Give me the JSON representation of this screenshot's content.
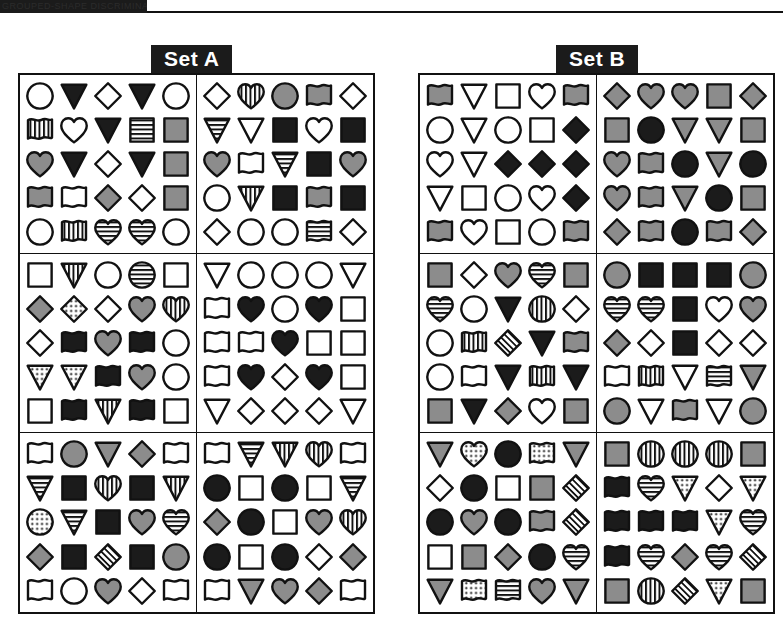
{
  "topbar": {
    "text": "GROUPED-SHAPE DISCRIMINATION"
  },
  "sets": [
    {
      "name": "Set A",
      "label_name": "set-a-label",
      "blocks": [
        {
          "name": "set-a-block-1",
          "rows": [
            [
              "circle|white",
              "triangle-down|black",
              "diamond|white",
              "triangle-down|black",
              "circle|white"
            ],
            [
              "flag|vstripe",
              "heart|white",
              "triangle-down|black",
              "square|hstripe",
              "square|gray"
            ],
            [
              "heart|gray",
              "triangle-down|black",
              "diamond|white",
              "triangle-down|black",
              "square|gray"
            ],
            [
              "flag|gray",
              "flag|white",
              "diamond|gray",
              "diamond|white",
              "square|gray"
            ],
            [
              "circle|white",
              "flag|vstripe",
              "heart|hstripe",
              "heart|hstripe",
              "circle|white"
            ]
          ]
        },
        {
          "name": "set-a-block-2",
          "rows": [
            [
              "diamond|white",
              "heart|vstripe",
              "circle|gray",
              "flag|gray",
              "diamond|white"
            ],
            [
              "triangle-down|hstripe",
              "triangle-down|white",
              "square|black",
              "heart|white",
              "square|black"
            ],
            [
              "heart|gray",
              "flag|white",
              "triangle-down|hstripe",
              "square|black",
              "heart|gray"
            ],
            [
              "circle|white",
              "triangle-down|vstripe",
              "square|black",
              "flag|gray",
              "square|black"
            ],
            [
              "diamond|white",
              "circle|white",
              "circle|white",
              "flag|hstripe",
              "diamond|white"
            ]
          ]
        },
        {
          "name": "set-a-block-3",
          "rows": [
            [
              "square|white",
              "triangle-down|vstripe",
              "circle|white",
              "circle|hstripe",
              "square|white"
            ],
            [
              "diamond|gray",
              "diamond|dots",
              "diamond|white",
              "heart|gray",
              "heart|vstripe"
            ],
            [
              "diamond|white",
              "flag|black",
              "heart|gray",
              "flag|black",
              "circle|white"
            ],
            [
              "triangle-down|dots",
              "triangle-down|dots",
              "flag|black",
              "heart|gray",
              "circle|white"
            ],
            [
              "square|white",
              "flag|black",
              "triangle-down|vstripe",
              "flag|black",
              "square|white"
            ]
          ]
        },
        {
          "name": "set-a-block-4",
          "rows": [
            [
              "triangle-down|white",
              "circle|white",
              "circle|white",
              "circle|white",
              "triangle-down|white"
            ],
            [
              "flag|white",
              "heart|black",
              "circle|white",
              "heart|black",
              "square|white"
            ],
            [
              "flag|white",
              "flag|white",
              "heart|black",
              "square|white",
              "square|white"
            ],
            [
              "flag|white",
              "heart|black",
              "diamond|white",
              "heart|black",
              "square|white"
            ],
            [
              "triangle-down|white",
              "diamond|white",
              "diamond|white",
              "diamond|white",
              "triangle-down|white"
            ]
          ]
        },
        {
          "name": "set-a-block-5",
          "rows": [
            [
              "flag|white",
              "circle|gray",
              "triangle-down|gray",
              "diamond|gray",
              "flag|white"
            ],
            [
              "triangle-down|hstripe",
              "square|black",
              "heart|vstripe",
              "square|black",
              "triangle-down|vstripe"
            ],
            [
              "circle|dots",
              "triangle-down|hstripe",
              "square|black",
              "heart|gray",
              "heart|hstripe"
            ],
            [
              "diamond|gray",
              "square|black",
              "diamond|hatch",
              "square|black",
              "circle|gray"
            ],
            [
              "flag|white",
              "circle|white",
              "heart|gray",
              "diamond|white",
              "flag|white"
            ]
          ]
        },
        {
          "name": "set-a-block-6",
          "rows": [
            [
              "flag|white",
              "triangle-down|hstripe",
              "triangle-down|vstripe",
              "heart|vstripe",
              "flag|white"
            ],
            [
              "circle|black",
              "square|white",
              "circle|black",
              "square|white",
              "triangle-down|hstripe"
            ],
            [
              "diamond|gray",
              "circle|black",
              "square|white",
              "heart|gray",
              "heart|vstripe"
            ],
            [
              "circle|black",
              "square|white",
              "circle|black",
              "diamond|white",
              "diamond|gray"
            ],
            [
              "flag|white",
              "triangle-down|gray",
              "heart|gray",
              "diamond|gray",
              "flag|white"
            ]
          ]
        }
      ]
    },
    {
      "name": "Set B",
      "label_name": "set-b-label",
      "blocks": [
        {
          "name": "set-b-block-1",
          "rows": [
            [
              "flag|gray",
              "triangle-down|white",
              "square|white",
              "heart|white",
              "flag|gray"
            ],
            [
              "circle|white",
              "triangle-down|white",
              "circle|white",
              "square|white",
              "diamond|black"
            ],
            [
              "heart|white",
              "triangle-down|white",
              "diamond|black",
              "diamond|black",
              "diamond|black"
            ],
            [
              "triangle-down|white",
              "square|white",
              "circle|white",
              "heart|white",
              "diamond|black"
            ],
            [
              "flag|gray",
              "heart|white",
              "square|white",
              "circle|white",
              "flag|gray"
            ]
          ]
        },
        {
          "name": "set-b-block-2",
          "rows": [
            [
              "diamond|gray",
              "heart|gray",
              "heart|gray",
              "square|gray",
              "diamond|gray"
            ],
            [
              "square|gray",
              "circle|black",
              "triangle-down|gray",
              "triangle-down|gray",
              "square|gray"
            ],
            [
              "heart|gray",
              "flag|gray",
              "circle|black",
              "triangle-down|gray",
              "circle|black"
            ],
            [
              "heart|gray",
              "flag|gray",
              "triangle-down|gray",
              "circle|black",
              "square|gray"
            ],
            [
              "diamond|gray",
              "flag|gray",
              "circle|black",
              "flag|gray",
              "diamond|gray"
            ]
          ]
        },
        {
          "name": "set-b-block-3",
          "rows": [
            [
              "square|gray",
              "diamond|white",
              "heart|gray",
              "heart|hstripe",
              "square|gray"
            ],
            [
              "heart|hstripe",
              "circle|white",
              "triangle-down|black",
              "circle|vstripe",
              "diamond|white"
            ],
            [
              "circle|white",
              "flag|vstripe",
              "diamond|hatch",
              "triangle-down|black",
              "flag|gray"
            ],
            [
              "circle|white",
              "flag|white",
              "triangle-down|black",
              "flag|vstripe",
              "triangle-down|black"
            ],
            [
              "square|gray",
              "triangle-down|black",
              "diamond|gray",
              "heart|white",
              "square|gray"
            ]
          ]
        },
        {
          "name": "set-b-block-4",
          "rows": [
            [
              "circle|gray",
              "square|black",
              "square|black",
              "square|black",
              "circle|gray"
            ],
            [
              "heart|hstripe",
              "heart|hstripe",
              "square|black",
              "heart|white",
              "heart|gray"
            ],
            [
              "diamond|gray",
              "diamond|white",
              "square|black",
              "diamond|white",
              "diamond|white"
            ],
            [
              "flag|white",
              "flag|vstripe",
              "triangle-down|white",
              "flag|hstripe",
              "triangle-down|gray"
            ],
            [
              "circle|gray",
              "triangle-down|white",
              "flag|gray",
              "triangle-down|white",
              "circle|gray"
            ]
          ]
        },
        {
          "name": "set-b-block-5",
          "rows": [
            [
              "triangle-down|gray",
              "heart|dots",
              "circle|black",
              "flag|dots",
              "triangle-down|gray"
            ],
            [
              "diamond|white",
              "circle|black",
              "square|white",
              "square|gray",
              "diamond|hatch"
            ],
            [
              "circle|black",
              "heart|gray",
              "circle|black",
              "flag|gray",
              "diamond|hatch"
            ],
            [
              "square|white",
              "square|gray",
              "diamond|gray",
              "circle|black",
              "heart|hstripe"
            ],
            [
              "triangle-down|gray",
              "flag|dots",
              "flag|hstripe",
              "heart|gray",
              "triangle-down|gray"
            ]
          ]
        },
        {
          "name": "set-b-block-6",
          "rows": [
            [
              "square|gray",
              "circle|vstripe",
              "circle|vstripe",
              "circle|vstripe",
              "square|gray"
            ],
            [
              "flag|black",
              "heart|hstripe",
              "triangle-down|dots",
              "diamond|white",
              "triangle-down|dots"
            ],
            [
              "flag|black",
              "flag|black",
              "flag|black",
              "triangle-down|dots",
              "heart|hstripe"
            ],
            [
              "flag|black",
              "heart|hstripe",
              "diamond|gray",
              "heart|hstripe",
              "diamond|hatch"
            ],
            [
              "square|gray",
              "circle|vstripe",
              "diamond|hatch",
              "triangle-down|dots",
              "square|gray"
            ]
          ]
        }
      ]
    }
  ],
  "colors": {
    "ink": "#111111",
    "gray_fill": "#8c8c8c",
    "black_fill": "#1b1b1b",
    "white_fill": "#ffffff",
    "label_bg": "#1b1b1b",
    "label_text": "#ffffff"
  }
}
